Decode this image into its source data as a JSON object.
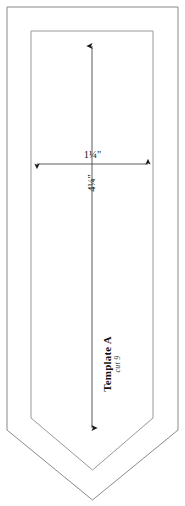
{
  "canvas": {
    "width": 506,
    "background": "#ffffff"
  },
  "pattern": {
    "name": "Template A",
    "cut_instruction": "cut 9",
    "shape": "pentagon-pointed-bottom",
    "outline_color": "#888888",
    "seam_line_color": "#999999",
    "dimension_color": "#1a1a1a"
  },
  "dimensions": {
    "width_label": "1¼\"",
    "length_label": "4¼\"",
    "width_value": 1.25,
    "length_value": 4.25,
    "units": "inches"
  },
  "geometry": {
    "cut_line": {
      "points": "7,7 178,7 178,430 92.5,500 7,430",
      "description": "outer cutting line"
    },
    "seam_line": {
      "points": "31,31 153,31 153,418 92.5,470 31,418",
      "description": "inner seam allowance line"
    },
    "vertical_arrow": {
      "x": 92,
      "y_top": 42,
      "y_bottom": 432
    },
    "horizontal_arrow": {
      "y": 164,
      "x_left": 33,
      "x_right": 152
    }
  }
}
